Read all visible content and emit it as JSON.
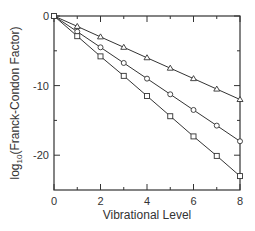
{
  "chart_data": {
    "type": "line",
    "title": "",
    "xlabel": "Vibrational Level",
    "ylabel_prefix": "log",
    "ylabel_sub": "10",
    "ylabel_suffix": "(Franck-Condon Factor)",
    "ylabel": "log10(Franck-Condon Factor)",
    "xlim": [
      0,
      8
    ],
    "ylim": [
      -25,
      0
    ],
    "x_ticks": [
      0,
      2,
      4,
      6,
      8
    ],
    "x_minor_ticks": [
      1,
      3,
      5,
      7
    ],
    "y_ticks": [
      0,
      -10,
      -20
    ],
    "y_minor_ticks": [
      -5,
      -15
    ],
    "grid": false,
    "legend": null,
    "x": [
      0,
      1,
      2,
      3,
      4,
      5,
      6,
      7,
      8
    ],
    "series": [
      {
        "name": "triangles",
        "marker": "triangle",
        "values": [
          0,
          -1.5,
          -3.0,
          -4.5,
          -6.0,
          -7.5,
          -9.0,
          -10.5,
          -12.0
        ]
      },
      {
        "name": "circles",
        "marker": "circle",
        "values": [
          0,
          -2.25,
          -4.5,
          -6.75,
          -9.0,
          -11.25,
          -13.5,
          -15.75,
          -18.0
        ]
      },
      {
        "name": "squares",
        "marker": "square",
        "values": [
          0,
          -2.9,
          -5.8,
          -8.6,
          -11.5,
          -14.4,
          -17.3,
          -20.1,
          -23.0
        ]
      }
    ]
  }
}
